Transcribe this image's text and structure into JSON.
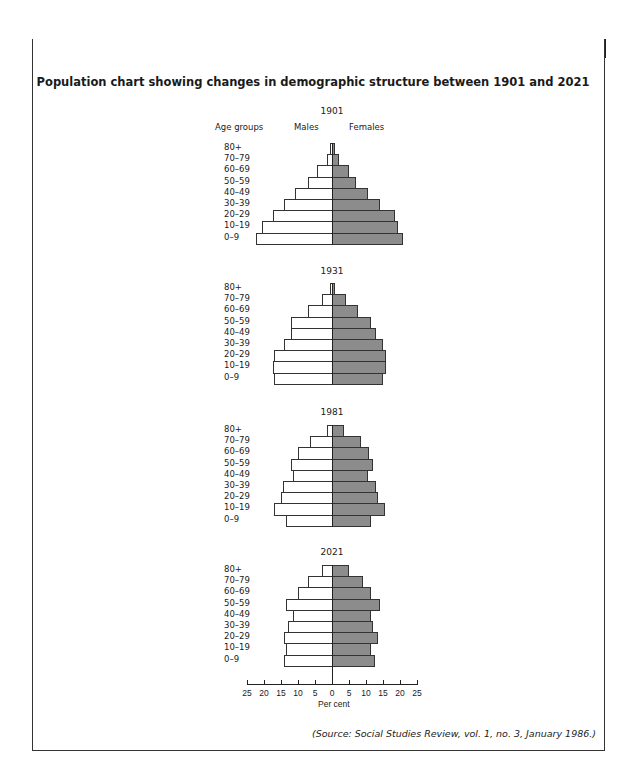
{
  "header": {
    "label": "ITEM A"
  },
  "title": "Population chart showing changes in demographic structure between 1901 and 2021",
  "labels": {
    "age_groups": "Age groups",
    "males": "Males",
    "females": "Females"
  },
  "axis": {
    "title": "Per cent",
    "ticks": [
      "25",
      "20",
      "15",
      "10",
      "5",
      "0",
      "5",
      "10",
      "15",
      "20",
      "25"
    ]
  },
  "source": "(Source: Social Studies Review, vol. 1, no. 3, January 1986.)",
  "colors": {
    "male_fill": "#ffffff",
    "female_fill": "#8c8c8c",
    "header_bg": "#231f20"
  },
  "chart_data": {
    "type": "bar",
    "subtype": "population-pyramid",
    "title": "Population chart showing changes in demographic structure between 1901 and 2021",
    "xlabel": "Per cent",
    "ylabel": "Age groups",
    "xlim": [
      -25,
      25
    ],
    "categories": [
      "80+",
      "70–79",
      "60–69",
      "50–59",
      "40–49",
      "30–39",
      "20–29",
      "10–19",
      "0–9"
    ],
    "legend": [
      "Males",
      "Females"
    ],
    "pyramids": [
      {
        "year": "1901",
        "males": [
          0.5,
          1.5,
          4.5,
          7,
          11,
          14,
          17.5,
          20.5,
          22.5
        ],
        "females": [
          1,
          2,
          5,
          7,
          10.5,
          14,
          18.5,
          19.5,
          21
        ]
      },
      {
        "year": "1931",
        "males": [
          0.5,
          3,
          7,
          12,
          12,
          14,
          17,
          17.5,
          17
        ],
        "females": [
          1,
          4,
          7.5,
          11.5,
          13,
          15,
          16,
          16,
          15
        ]
      },
      {
        "year": "1981",
        "males": [
          1.5,
          6.5,
          10,
          12,
          11.5,
          14.5,
          15,
          17,
          13.5
        ],
        "females": [
          3.5,
          8.5,
          11,
          12,
          10.5,
          13,
          13.5,
          15.5,
          11.5
        ]
      },
      {
        "year": "2021",
        "males": [
          3,
          7,
          10,
          13.5,
          11.5,
          13,
          14,
          13.5,
          14
        ],
        "females": [
          5,
          9,
          11.5,
          14,
          11.5,
          12,
          13.5,
          11.5,
          12.5
        ]
      }
    ]
  }
}
